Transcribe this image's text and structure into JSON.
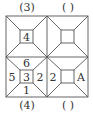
{
  "labels": {
    "top_left": "(3)",
    "top_right": "(  )",
    "bottom_left": "(4)",
    "bottom_right": "(  )"
  },
  "cubes": {
    "top_left": {
      "center": "4"
    },
    "top_right": {
      "center": ""
    },
    "bottom_left": {
      "top": "6",
      "left": "5",
      "center": "3",
      "right": "2",
      "bottom": "1"
    },
    "bottom_right": {
      "left": "2",
      "right": "A"
    }
  },
  "colors": {
    "line": "#555555",
    "text": "#333333"
  }
}
